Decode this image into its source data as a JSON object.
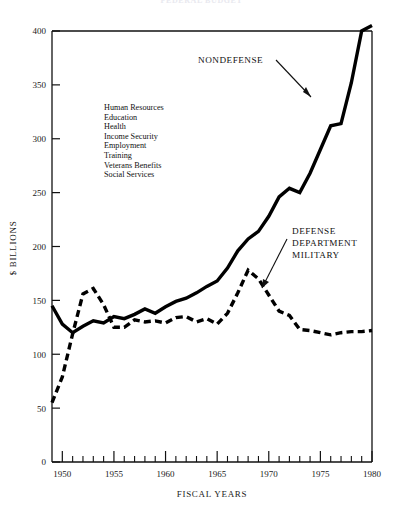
{
  "title": "FEDERAL BUDGET",
  "chart_data": {
    "type": "line",
    "title": "FEDERAL BUDGET",
    "xlabel": "FISCAL YEARS",
    "ylabel": "$ BILLIONS",
    "xlim": [
      1949,
      1980
    ],
    "ylim": [
      0,
      400
    ],
    "grid": false,
    "legend_position": "inline-annotations",
    "ytick_labels": [
      "0",
      "50",
      "100",
      "150",
      "200",
      "250",
      "300",
      "350",
      "400"
    ],
    "ytick_values": [
      0,
      50,
      100,
      150,
      200,
      250,
      300,
      350,
      400
    ],
    "xtick_labels": [
      "1950",
      "1955",
      "1960",
      "1965",
      "1970",
      "1975",
      "1980"
    ],
    "xtick_values": [
      1950,
      1955,
      1960,
      1965,
      1970,
      1975,
      1980
    ],
    "x": [
      1949,
      1950,
      1951,
      1952,
      1953,
      1954,
      1955,
      1956,
      1957,
      1958,
      1959,
      1960,
      1961,
      1962,
      1963,
      1964,
      1965,
      1966,
      1967,
      1968,
      1969,
      1970,
      1971,
      1972,
      1973,
      1974,
      1975,
      1976,
      1977,
      1978,
      1979,
      1980
    ],
    "series": [
      {
        "name": "NONDEFENSE",
        "style": "solid",
        "values": [
          145,
          128,
          120,
          126,
          131,
          129,
          135,
          133,
          137,
          142,
          138,
          144,
          149,
          152,
          157,
          163,
          168,
          180,
          196,
          207,
          214,
          228,
          246,
          254,
          250,
          268,
          290,
          312,
          314,
          352,
          400,
          405
        ]
      },
      {
        "name": "DEFENSE DEPARTMENT MILITARY",
        "style": "dashed",
        "values": [
          55,
          79,
          119,
          156,
          161,
          146,
          125,
          125,
          132,
          130,
          131,
          129,
          134,
          135,
          130,
          133,
          128,
          138,
          157,
          178,
          170,
          155,
          140,
          136,
          123,
          122,
          120,
          118,
          120,
          121,
          121,
          122
        ]
      }
    ],
    "annotations": [
      {
        "label": "NONDEFENSE",
        "target_year": 1976,
        "target_value": 310
      },
      {
        "label": "DEFENSE DEPARTMENT MILITARY",
        "lines": [
          "DEFENSE",
          "DEPARTMENT",
          "MILITARY"
        ],
        "target_year": 1969,
        "target_value": 172
      }
    ],
    "legend_block": {
      "items": [
        "Human Resources",
        "Education",
        "Health",
        "Income Security",
        "Employment",
        "Training",
        "Veterans Benefits",
        "Social Services"
      ]
    }
  }
}
